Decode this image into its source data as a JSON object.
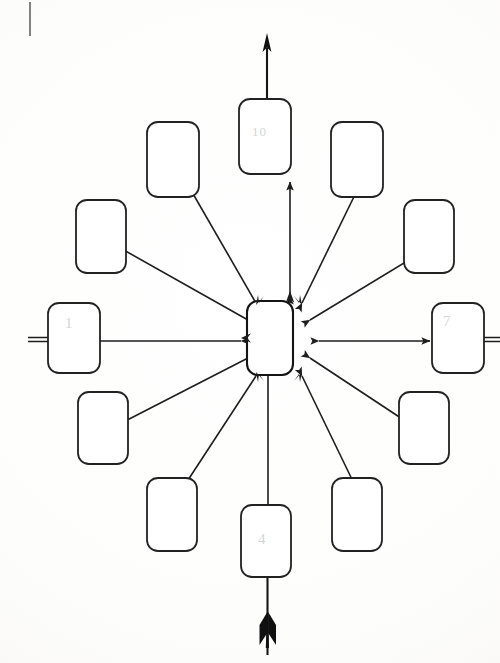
{
  "document": {
    "title": "Hand-drawn radial spider diagram",
    "type": "scanned-diagram",
    "background_color": "#fdfdfc",
    "ink_color": "#1d1d1d",
    "faint_ink_color": "#9a9a9a",
    "width": 500,
    "height": 663
  },
  "center": {
    "name": "center-node",
    "label": "",
    "x": 270,
    "y": 337,
    "w": 46,
    "h": 72
  },
  "nodes": [
    {
      "id": "n-top",
      "label": "10",
      "has_label": true,
      "x": 239,
      "y": 99,
      "w": 52,
      "h": 75,
      "direction": "north"
    },
    {
      "id": "n-nne",
      "label": "",
      "has_label": false,
      "x": 331,
      "y": 122,
      "w": 52,
      "h": 75,
      "direction": "north-northeast"
    },
    {
      "id": "n-nnw",
      "label": "",
      "has_label": false,
      "x": 147,
      "y": 122,
      "w": 52,
      "h": 75,
      "direction": "north-northwest"
    },
    {
      "id": "n-ene",
      "label": "",
      "has_label": false,
      "x": 404,
      "y": 200,
      "w": 50,
      "h": 73,
      "direction": "east-northeast"
    },
    {
      "id": "n-wnw",
      "label": "",
      "has_label": false,
      "x": 76,
      "y": 200,
      "w": 50,
      "h": 73,
      "direction": "west-northwest"
    },
    {
      "id": "n-right",
      "label": "7",
      "has_label": true,
      "x": 432,
      "y": 303,
      "w": 52,
      "h": 70,
      "direction": "east"
    },
    {
      "id": "n-left",
      "label": "1",
      "has_label": true,
      "x": 48,
      "y": 303,
      "w": 52,
      "h": 70,
      "direction": "west"
    },
    {
      "id": "n-ese",
      "label": "",
      "has_label": false,
      "x": 399,
      "y": 392,
      "w": 50,
      "h": 72,
      "direction": "east-southeast"
    },
    {
      "id": "n-wsw",
      "label": "",
      "has_label": false,
      "x": 78,
      "y": 392,
      "w": 50,
      "h": 72,
      "direction": "west-southwest"
    },
    {
      "id": "n-sse",
      "label": "",
      "has_label": false,
      "x": 332,
      "y": 478,
      "w": 50,
      "h": 73,
      "direction": "south-southeast"
    },
    {
      "id": "n-ssw",
      "label": "",
      "has_label": false,
      "x": 147,
      "y": 478,
      "w": 50,
      "h": 73,
      "direction": "south-southwest"
    },
    {
      "id": "n-bottom",
      "label": "4",
      "has_label": true,
      "x": 241,
      "y": 505,
      "w": 50,
      "h": 72,
      "direction": "south"
    }
  ],
  "connectors": [
    {
      "id": "c-top",
      "from": "center",
      "to": "n-top",
      "style": "double-headed-arrow"
    },
    {
      "id": "c-nne",
      "from": "center",
      "to": "n-nne",
      "style": "double-headed-arrow"
    },
    {
      "id": "c-nnw",
      "from": "center",
      "to": "n-nnw",
      "style": "double-headed-arrow"
    },
    {
      "id": "c-ene",
      "from": "center",
      "to": "n-ene",
      "style": "double-headed-arrow"
    },
    {
      "id": "c-wnw",
      "from": "center",
      "to": "n-wnw",
      "style": "double-headed-arrow"
    },
    {
      "id": "c-right",
      "from": "center",
      "to": "n-right",
      "style": "double-headed-arrow"
    },
    {
      "id": "c-left",
      "from": "center",
      "to": "n-left",
      "style": "double-headed-arrow"
    },
    {
      "id": "c-ese",
      "from": "center",
      "to": "n-ese",
      "style": "double-headed-arrow"
    },
    {
      "id": "c-wsw",
      "from": "center",
      "to": "n-wsw",
      "style": "double-headed-arrow"
    },
    {
      "id": "c-sse",
      "from": "center",
      "to": "n-sse",
      "style": "double-headed-arrow"
    },
    {
      "id": "c-ssw",
      "from": "center",
      "to": "n-ssw",
      "style": "double-headed-arrow"
    },
    {
      "id": "c-bottom",
      "from": "center",
      "to": "n-bottom",
      "style": "double-headed-arrow"
    }
  ],
  "overlay": {
    "vertical_shaft": {
      "name": "vertical-arrow-shaft",
      "top_y": 34,
      "bottom_y": 655,
      "x": 267,
      "head": "arrowhead-up",
      "tail": "arrow-fletching"
    },
    "left_stub": {
      "name": "left-margin-line",
      "x1": 28,
      "y1": 339,
      "x2": 56,
      "y2": 339
    },
    "right_stub": {
      "name": "right-margin-line",
      "x1": 480,
      "y1": 339,
      "x2": 500,
      "y2": 339
    },
    "corner_tick": {
      "name": "page-corner-tick",
      "x": 30,
      "y1": 2,
      "y2": 36
    }
  }
}
